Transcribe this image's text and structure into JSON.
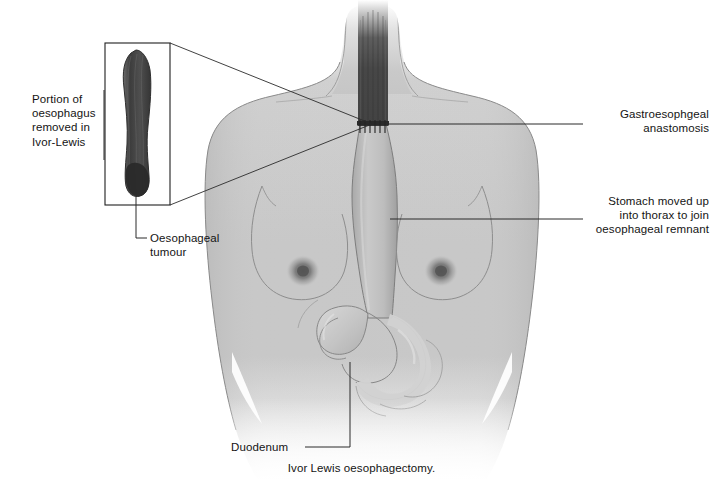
{
  "figure": {
    "title": "Ivor Lewis oesophagectomy",
    "caption": "Ivor Lewis oesophagectomy.",
    "background_color": "#ffffff",
    "width": 723,
    "height": 484
  },
  "palette": {
    "body_fill": "#c8c8c8",
    "body_outline": "#6e6e6e",
    "esophagus_dark": "#4a4a4a",
    "specimen_dark": "#464646",
    "stomach_fill": "#b4b4b4",
    "bowel_light": "#cfcfcf",
    "leader_line": "#2b2b2b",
    "text_color": "#141414",
    "inset_border": "#1f1f1f",
    "areola": "#8e8e8e"
  },
  "labels": [
    {
      "id": "portion-removed",
      "text": "Portion of\noesophagus\nremoved in\nIvor-Lewis",
      "align": "left",
      "x": 32,
      "y": 92,
      "width": 86
    },
    {
      "id": "oesophageal-tumour",
      "text": "Oesophageal\ntumour",
      "align": "left",
      "x": 150,
      "y": 231,
      "width": 92
    },
    {
      "id": "gastroesophageal-anastomosis",
      "text": "Gastroesophgeal\nanastomosis",
      "align": "right",
      "x": 563,
      "y": 107,
      "width": 146
    },
    {
      "id": "stomach-moved-up",
      "text": "Stomach moved up\ninto thorax to join\noesophageal remnant",
      "align": "right",
      "x": 575,
      "y": 194,
      "width": 134
    },
    {
      "id": "duodenum",
      "text": "Duodenum",
      "align": "left",
      "x": 231,
      "y": 443,
      "width": 70
    }
  ],
  "anatomy": {
    "structures": [
      "torso",
      "neck",
      "shoulders",
      "breasts",
      "oesophageal-remnant",
      "anastomosis-suture-line",
      "gastric-conduit",
      "stomach",
      "duodenum",
      "small-bowel-loops"
    ],
    "inset": {
      "name": "resected-oesophagus-specimen",
      "box": {
        "x": 105,
        "y": 43,
        "width": 65,
        "height": 162
      },
      "contains": "oesophagus with tumour"
    },
    "anastomosis_point": {
      "x": 372,
      "y": 124
    }
  },
  "icon_names": {
    "inset_box": "magnifier-inset-box",
    "leader": "leader-line"
  }
}
